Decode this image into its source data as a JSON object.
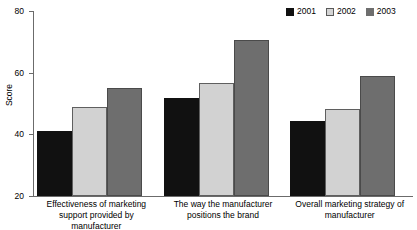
{
  "chart_data": {
    "type": "bar",
    "title": "",
    "xlabel": "",
    "ylabel": "Score",
    "ylim": [
      20,
      80
    ],
    "yticks": [
      20,
      40,
      60,
      80
    ],
    "grid": false,
    "legend_position": "top-right",
    "categories": [
      "Effectiveness of marketing support provided by manufacturer",
      "The way the manufacturer positions the brand",
      "Overall marketing strategy of manufacturer"
    ],
    "category_lines": [
      [
        "Effectiveness of marketing",
        "support provided by manufacturer"
      ],
      [
        "The way the manufacturer",
        "positions the brand"
      ],
      [
        "Overall marketing strategy of",
        "manufacturer"
      ]
    ],
    "series": [
      {
        "name": "2001",
        "color": "#111111",
        "values": [
          41,
          51.8,
          44.3
        ]
      },
      {
        "name": "2002",
        "color": "#d2d2d2",
        "values": [
          48.8,
          56.5,
          48.2
        ]
      },
      {
        "name": "2003",
        "color": "#6e6e6e",
        "values": [
          55,
          70.5,
          59
        ]
      }
    ]
  },
  "legend": {
    "entries": [
      {
        "label": "2001"
      },
      {
        "label": "2002"
      },
      {
        "label": "2003"
      }
    ]
  },
  "axis": {
    "y_title": "Score",
    "y_tick_labels": [
      "80",
      "60",
      "40",
      "20"
    ]
  }
}
